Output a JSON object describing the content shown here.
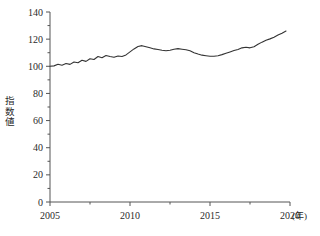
{
  "chart_data": {
    "type": "line",
    "title": "",
    "xlabel": "(年)",
    "ylabel": "指数値",
    "ylabel_chars": [
      "指",
      "数",
      "値"
    ],
    "xlim": [
      2005,
      2020
    ],
    "ylim": [
      0,
      140
    ],
    "yticks": [
      0,
      20,
      40,
      60,
      80,
      100,
      120,
      140
    ],
    "ytick_labels": [
      "0",
      "20",
      "40",
      "60",
      "80",
      "100",
      "120",
      "140"
    ],
    "yminor_step": 10,
    "xticks": [
      2005,
      2010,
      2015,
      2020
    ],
    "xtick_labels": [
      "2005",
      "2010",
      "2015",
      "2020"
    ],
    "xminor_step": 2.5,
    "grid": false,
    "legend": null,
    "line_color": "#333333",
    "line_width": 1.1,
    "series": [
      {
        "name": "指数値",
        "x": [
          2005.0,
          2005.25,
          2005.5,
          2005.75,
          2006.0,
          2006.25,
          2006.5,
          2006.75,
          2007.0,
          2007.25,
          2007.5,
          2007.75,
          2008.0,
          2008.25,
          2008.5,
          2008.75,
          2009.0,
          2009.25,
          2009.5,
          2009.75,
          2010.0,
          2010.25,
          2010.5,
          2010.75,
          2011.0,
          2011.25,
          2011.5,
          2011.75,
          2012.0,
          2012.25,
          2012.5,
          2012.75,
          2013.0,
          2013.25,
          2013.5,
          2013.75,
          2014.0,
          2014.25,
          2014.5,
          2014.75,
          2015.0,
          2015.25,
          2015.5,
          2015.75,
          2016.0,
          2016.25,
          2016.5,
          2016.75,
          2017.0,
          2017.25,
          2017.5,
          2017.75,
          2018.0,
          2018.25,
          2018.5,
          2018.75,
          2019.0,
          2019.25,
          2019.5,
          2019.75
        ],
        "values": [
          100.0,
          100.3,
          101.5,
          100.8,
          102.0,
          101.4,
          103.2,
          102.6,
          104.4,
          103.6,
          105.6,
          105.0,
          107.2,
          106.3,
          108.0,
          107.2,
          106.6,
          107.6,
          107.2,
          108.4,
          110.6,
          112.8,
          114.6,
          115.2,
          114.4,
          113.6,
          112.8,
          112.4,
          111.8,
          111.4,
          111.8,
          112.6,
          113.0,
          112.6,
          112.2,
          111.4,
          110.0,
          109.0,
          108.2,
          107.8,
          107.4,
          107.4,
          107.8,
          108.6,
          109.6,
          110.6,
          111.6,
          112.4,
          113.6,
          114.0,
          113.6,
          114.4,
          116.2,
          117.8,
          119.2,
          120.2,
          121.4,
          123.0,
          124.4,
          126.0
        ]
      }
    ]
  }
}
